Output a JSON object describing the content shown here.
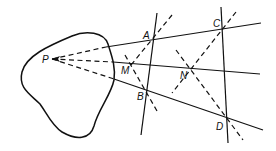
{
  "diagram": {
    "type": "geometric-construction",
    "points": {
      "P": {
        "label": "P",
        "x": 52,
        "y": 59
      },
      "A": {
        "label": "A",
        "x": 153,
        "y": 41
      },
      "B": {
        "label": "B",
        "x": 146,
        "y": 90
      },
      "C": {
        "label": "C",
        "x": 222,
        "y": 28
      },
      "D": {
        "label": "D",
        "x": 226,
        "y": 117
      },
      "M": {
        "label": "M",
        "x": 132,
        "y": 65
      },
      "N": {
        "label": "N",
        "x": 190,
        "y": 69
      }
    },
    "labels": {
      "P": "P",
      "A": "A",
      "B": "B",
      "C": "C",
      "D": "D",
      "M": "M",
      "N": "N"
    }
  }
}
